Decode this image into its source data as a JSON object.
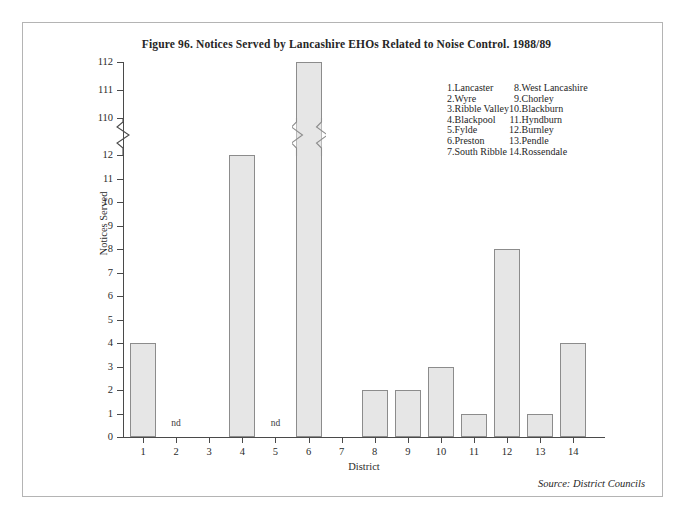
{
  "figure": {
    "title": "Figure 96.  Notices Served by Lancashire EHOs Related to Noise Control. 1988/89",
    "source_label": "Source: District Councils"
  },
  "legend": {
    "left_column": [
      {
        "num": "1.",
        "name": "Lancaster"
      },
      {
        "num": "2.",
        "name": "Wyre"
      },
      {
        "num": "3.",
        "name": "Ribble Valley"
      },
      {
        "num": "4.",
        "name": "Blackpool"
      },
      {
        "num": "5.",
        "name": "Fylde"
      },
      {
        "num": "6.",
        "name": "Preston"
      },
      {
        "num": "7.",
        "name": "South Ribble"
      }
    ],
    "right_column": [
      {
        "num": "8.",
        "name": "West Lancashire"
      },
      {
        "num": "9.",
        "name": "Chorley"
      },
      {
        "num": "10.",
        "name": "Blackburn"
      },
      {
        "num": "11.",
        "name": "Hyndburn"
      },
      {
        "num": "12.",
        "name": "Burnley"
      },
      {
        "num": "13.",
        "name": "Pendle"
      },
      {
        "num": "14.",
        "name": "Rossendale"
      }
    ]
  },
  "chart_data": {
    "type": "bar",
    "title": "Figure 96.  Notices Served by Lancashire EHOs Related to Noise Control. 1988/89",
    "xlabel": "District",
    "ylabel": "Notices Served",
    "categories": [
      "1",
      "2",
      "3",
      "4",
      "5",
      "6",
      "7",
      "8",
      "9",
      "10",
      "11",
      "12",
      "13",
      "14"
    ],
    "category_names": [
      "Lancaster",
      "Wyre",
      "Ribble Valley",
      "Blackpool",
      "Fylde",
      "Preston",
      "South Ribble",
      "West Lancashire",
      "Chorley",
      "Blackburn",
      "Hyndburn",
      "Burnley",
      "Pendle",
      "Rossendale"
    ],
    "values": [
      4,
      null,
      0,
      12,
      null,
      112,
      0,
      2,
      2,
      3,
      1,
      8,
      1,
      4
    ],
    "value_annotations": [
      "",
      "nd",
      "",
      "",
      "nd",
      "",
      "",
      "",
      "",
      "",
      "",
      "",
      "",
      ""
    ],
    "no_data_label": "nd",
    "no_data_categories": [
      "2",
      "5"
    ],
    "y_ticks": [
      "0",
      "1",
      "2",
      "3",
      "4",
      "5",
      "6",
      "7",
      "8",
      "9",
      "10",
      "11",
      "12",
      "110",
      "111",
      "112"
    ],
    "ylim": [
      0,
      112
    ],
    "axis_break": {
      "present": true,
      "lower": 12,
      "upper": 110,
      "style": "zigzag"
    },
    "grid": false,
    "legend_position": "upper-right",
    "bar_fill": "#e6e6e6",
    "bar_border": "#8c8c8c"
  }
}
